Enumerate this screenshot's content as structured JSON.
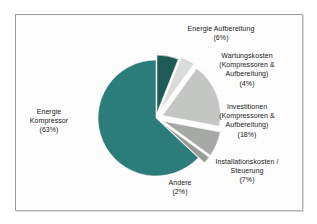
{
  "frame": {
    "border_color": "#9a9a9a",
    "background": "#ffffff"
  },
  "chart_data": {
    "type": "pie",
    "title": "",
    "subtitle": "",
    "xlabel": "",
    "ylabel": "",
    "legend_position": "labels-outside",
    "grid": false,
    "unit": "%",
    "exploded": true,
    "start_angle_deg": -90,
    "direction": "clockwise",
    "categories": [
      "Energie Aufbereitung",
      "Wartungskosten (Kompressoren & Aufbereitung)",
      "Investitionen (Kompressoren & Aufbereitung)",
      "Installationskosten / Steuerung",
      "Andere",
      "Energie Kompressor"
    ],
    "values": [
      6,
      4,
      18,
      7,
      2,
      63
    ],
    "colors": [
      "#1e5c58",
      "#dcdedc",
      "#c5c8c5",
      "#a8aaa7",
      "#9a9c99",
      "#2c7d7b"
    ],
    "slices": [
      {
        "name": "Energie Aufbereitung",
        "value": 6,
        "label_text": "Energie Aufbereitung",
        "label_percent": "(6%)",
        "color": "#1e5c58"
      },
      {
        "name": "Wartungskosten",
        "value": 4,
        "label_text": "Wartungskosten\n(Kompressoren &\nAufbereitung)",
        "label_percent": "(4%)",
        "color": "#dcdedc"
      },
      {
        "name": "Investitionen",
        "value": 18,
        "label_text": "Investitionen\n(Kompressoren &\nAufbereitung)",
        "label_percent": "(18%)",
        "color": "#c5c8c5"
      },
      {
        "name": "Installationskosten / Steuerung",
        "value": 7,
        "label_text": "Installationskosten /\nSteuerung",
        "label_percent": "(7%)",
        "color": "#a8aaa7"
      },
      {
        "name": "Andere",
        "value": 2,
        "label_text": "Andere",
        "label_percent": "(2%)",
        "color": "#9a9c99"
      },
      {
        "name": "Energie Kompressor",
        "value": 63,
        "label_text": "Energie\nKompressor",
        "label_percent": "(63%)",
        "color": "#2c7d7b"
      }
    ]
  },
  "labels": {
    "energie_kompressor": "Energie\nKompressor\n(63%)",
    "energie_aufbereitung": "Energie Aufbereitung\n(6%)",
    "wartungskosten": "Wartungskosten\n(Kompressoren &\nAufbereitung)\n(4%)",
    "investitionen": "Investitionen\n(Kompressoren &\nAufbereitung)\n(18%)",
    "installationskosten": "Installationskosten /\nSteuerung\n(7%)",
    "andere": "Andere\n(2%)"
  }
}
